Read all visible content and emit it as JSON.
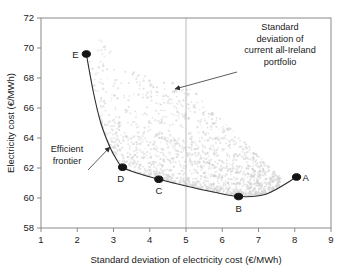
{
  "chart_data": {
    "type": "scatter",
    "title": "",
    "xlabel": "Standard deviation of electricity cost (€/MWh)",
    "ylabel": "Electricity cost (€/MWh)",
    "xlim": [
      1,
      9
    ],
    "ylim": [
      58,
      72
    ],
    "xticks": [
      "1",
      "2",
      "3",
      "4",
      "5",
      "6",
      "7",
      "8",
      "9"
    ],
    "yticks": [
      "58",
      "60",
      "62",
      "64",
      "66",
      "68",
      "70",
      "72"
    ],
    "grid": false,
    "legend": null,
    "series": [
      {
        "name": "Feasible portfolio cloud",
        "type": "scatter",
        "color": "#d2d2d2",
        "point_count": 1400,
        "description": "Dense light-grey cloud of feasible portfolios spanning roughly x 2.3 to 7.6 and y 60.1 to 71.1, bounded below by the efficient frontier"
      },
      {
        "name": "Efficient frontier",
        "type": "line",
        "color": "#2e2e2e",
        "points": [
          {
            "x": 2.25,
            "y": 69.6
          },
          {
            "x": 2.45,
            "y": 67.0
          },
          {
            "x": 2.65,
            "y": 65.0
          },
          {
            "x": 2.9,
            "y": 63.4
          },
          {
            "x": 3.1,
            "y": 62.5
          },
          {
            "x": 3.25,
            "y": 62.05
          },
          {
            "x": 3.6,
            "y": 61.7
          },
          {
            "x": 4.25,
            "y": 61.25
          },
          {
            "x": 5.0,
            "y": 60.8
          },
          {
            "x": 5.75,
            "y": 60.4
          },
          {
            "x": 6.45,
            "y": 60.1
          },
          {
            "x": 7.2,
            "y": 60.25
          },
          {
            "x": 8.05,
            "y": 61.4
          }
        ]
      },
      {
        "name": "Labelled portfolios",
        "type": "scatter",
        "color": "#141414",
        "points": [
          {
            "label": "A",
            "x": 8.05,
            "y": 61.4,
            "label_dx": 9,
            "label_dy": 4
          },
          {
            "label": "B",
            "x": 6.45,
            "y": 60.1,
            "label_dx": 0,
            "label_dy": 15
          },
          {
            "label": "C",
            "x": 4.25,
            "y": 61.25,
            "label_dx": 0,
            "label_dy": 15
          },
          {
            "label": "D",
            "x": 3.25,
            "y": 62.05,
            "label_dx": -2,
            "label_dy": 15
          },
          {
            "label": "E",
            "x": 2.25,
            "y": 69.6,
            "label_dx": -11,
            "label_dy": 4
          }
        ]
      }
    ],
    "reference_lines": [
      {
        "name": "current-portfolio-std-dev",
        "orientation": "vertical",
        "x": 5.0,
        "color": "#b9b9b9"
      }
    ],
    "annotations": [
      {
        "name": "std-dev-annotation",
        "lines": [
          "Standard",
          "deviation of",
          "current all-Ireland",
          "portfolio"
        ],
        "text_x": 280,
        "text_y": 30,
        "arrow_from": {
          "x": 237,
          "y": 72
        },
        "arrow_to": {
          "x": 175,
          "y": 89
        }
      },
      {
        "name": "efficient-frontier-annotation",
        "lines": [
          "Efficient",
          "frontier"
        ],
        "text_x": 67,
        "text_y": 152,
        "arrow_from": {
          "x": 88,
          "y": 170
        },
        "arrow_to": {
          "x": 110,
          "y": 147
        }
      }
    ]
  }
}
